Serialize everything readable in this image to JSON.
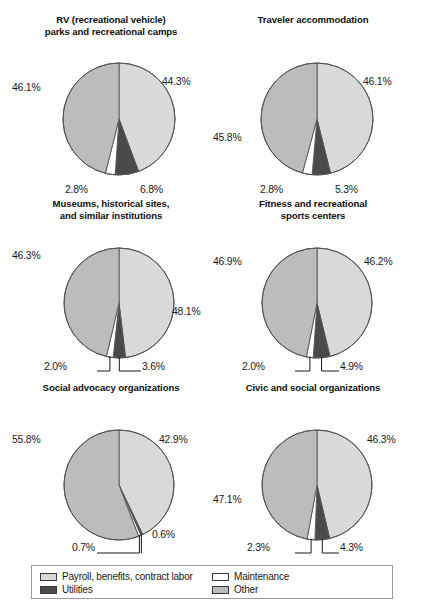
{
  "figure": {
    "background": "#ffffff",
    "slice_colors": {
      "payroll": "#d9d9d9",
      "utilities": "#4a4a4a",
      "maintenance": "#ffffff",
      "other": "#bcbcbc"
    },
    "outline_color": "#555555"
  },
  "legend": {
    "items": [
      {
        "label": "Payroll, benefits, contract labor",
        "key": "payroll",
        "color": "#d9d9d9"
      },
      {
        "label": "Maintenance",
        "key": "maintenance",
        "color": "#ffffff"
      },
      {
        "label": "Utilities",
        "key": "utilities",
        "color": "#4a4a4a"
      },
      {
        "label": "Other",
        "key": "other",
        "color": "#bcbcbc"
      }
    ]
  },
  "chart_data": [
    {
      "type": "pie",
      "title": "RV (recreational vehicle)\nparks and recreational camps",
      "categories": [
        "Payroll, benefits, contract labor",
        "Utilities",
        "Maintenance",
        "Other"
      ],
      "values": [
        44.3,
        6.8,
        2.8,
        46.1
      ],
      "labels": [
        "44.3%",
        "6.8%",
        "2.8%",
        "46.1%"
      ],
      "units": "percent",
      "start_angle_deg": 0,
      "direction": "clockwise",
      "leader_lines": false
    },
    {
      "type": "pie",
      "title": "Traveler accommodation",
      "categories": [
        "Payroll, benefits, contract labor",
        "Utilities",
        "Maintenance",
        "Other"
      ],
      "values": [
        46.1,
        5.3,
        2.8,
        45.8
      ],
      "labels": [
        "46.1%",
        "5.3%",
        "2.8%",
        "45.8%"
      ],
      "units": "percent",
      "start_angle_deg": 0,
      "direction": "clockwise",
      "leader_lines": false
    },
    {
      "type": "pie",
      "title": "Museums, historical sites,\nand similar institutions",
      "categories": [
        "Payroll, benefits, contract labor",
        "Utilities",
        "Maintenance",
        "Other"
      ],
      "values": [
        48.1,
        3.6,
        2.0,
        46.3
      ],
      "labels": [
        "48.1%",
        "3.6%",
        "2.0%",
        "46.3%"
      ],
      "units": "percent",
      "start_angle_deg": 0,
      "direction": "clockwise",
      "leader_lines": true
    },
    {
      "type": "pie",
      "title": "Fitness and recreational\nsports centers",
      "categories": [
        "Payroll, benefits, contract labor",
        "Utilities",
        "Maintenance",
        "Other"
      ],
      "values": [
        46.2,
        4.9,
        2.0,
        46.9
      ],
      "labels": [
        "46.2%",
        "4.9%",
        "2.0%",
        "46.9%"
      ],
      "units": "percent",
      "start_angle_deg": 0,
      "direction": "clockwise",
      "leader_lines": true
    },
    {
      "type": "pie",
      "title": "Social advocacy organizations",
      "categories": [
        "Payroll, benefits, contract labor",
        "Utilities",
        "Maintenance",
        "Other"
      ],
      "values": [
        42.9,
        0.6,
        0.7,
        55.8
      ],
      "labels": [
        "42.9%",
        "0.6%",
        "0.7%",
        "55.8%"
      ],
      "units": "percent",
      "start_angle_deg": 0,
      "direction": "clockwise",
      "leader_lines": true
    },
    {
      "type": "pie",
      "title": "Civic and social organizations",
      "categories": [
        "Payroll, benefits, contract labor",
        "Utilities",
        "Maintenance",
        "Other"
      ],
      "values": [
        46.3,
        4.3,
        2.3,
        47.1
      ],
      "labels": [
        "46.3%",
        "4.3%",
        "2.3%",
        "47.1%"
      ],
      "units": "percent",
      "start_angle_deg": 0,
      "direction": "clockwise",
      "leader_lines": true
    }
  ],
  "layout": {
    "panels": [
      {
        "left": 10,
        "top": 14,
        "width": 202,
        "cx": 109,
        "cy": 105,
        "r": 56,
        "label_pos": [
          {
            "x": 152,
            "y": 62,
            "align": "left"
          },
          {
            "x": 130,
            "y": 170,
            "align": "left"
          },
          {
            "x": 55,
            "y": 170,
            "align": "left"
          },
          {
            "x": 2,
            "y": 68,
            "align": "left"
          }
        ]
      },
      {
        "left": 212,
        "top": 14,
        "width": 202,
        "cx": 105,
        "cy": 105,
        "r": 56,
        "label_pos": [
          {
            "x": 151,
            "y": 62,
            "align": "left"
          },
          {
            "x": 123,
            "y": 170,
            "align": "left"
          },
          {
            "x": 48,
            "y": 170,
            "align": "left"
          },
          {
            "x": 1,
            "y": 118,
            "align": "left"
          }
        ]
      },
      {
        "left": 10,
        "top": 198,
        "width": 202,
        "cx": 109,
        "cy": 105,
        "r": 55,
        "label_pos": [
          {
            "x": 162,
            "y": 108,
            "align": "left"
          },
          {
            "x": 132,
            "y": 163,
            "align": "left"
          },
          {
            "x": 34,
            "y": 163,
            "align": "left"
          },
          {
            "x": 2,
            "y": 52,
            "align": "left"
          }
        ]
      },
      {
        "left": 212,
        "top": 198,
        "width": 202,
        "cx": 105,
        "cy": 105,
        "r": 55,
        "label_pos": [
          {
            "x": 152,
            "y": 58,
            "align": "left"
          },
          {
            "x": 128,
            "y": 163,
            "align": "left"
          },
          {
            "x": 30,
            "y": 163,
            "align": "left"
          },
          {
            "x": 1,
            "y": 58,
            "align": "left"
          }
        ]
      },
      {
        "left": 10,
        "top": 382,
        "width": 202,
        "cx": 109,
        "cy": 103,
        "r": 55,
        "label_pos": [
          {
            "x": 149,
            "y": 52,
            "align": "left"
          },
          {
            "x": 142,
            "y": 147,
            "align": "left"
          },
          {
            "x": 62,
            "y": 160,
            "align": "left"
          },
          {
            "x": 2,
            "y": 52,
            "align": "left"
          }
        ]
      },
      {
        "left": 212,
        "top": 382,
        "width": 202,
        "cx": 105,
        "cy": 103,
        "r": 55,
        "label_pos": [
          {
            "x": 155,
            "y": 52,
            "align": "left"
          },
          {
            "x": 128,
            "y": 160,
            "align": "left"
          },
          {
            "x": 35,
            "y": 160,
            "align": "left"
          },
          {
            "x": 1,
            "y": 112,
            "align": "left"
          }
        ]
      }
    ]
  }
}
